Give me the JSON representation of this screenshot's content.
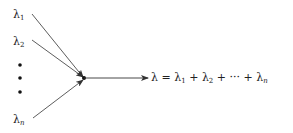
{
  "diagram": {
    "inputs": [
      {
        "symbol": "λ",
        "subscript": "1"
      },
      {
        "symbol": "λ",
        "subscript": "2"
      },
      {
        "symbol": "λ",
        "subscript": "n"
      }
    ],
    "ellipsis": "vertical-dots",
    "output": {
      "lhs": "λ",
      "equals": " = ",
      "terms": [
        {
          "symbol": "λ",
          "subscript": "1"
        },
        {
          "sep": " + "
        },
        {
          "symbol": "λ",
          "subscript": "2"
        },
        {
          "sep": " + ··· + "
        },
        {
          "symbol": "λ",
          "subscript": "n"
        }
      ]
    },
    "colors": {
      "line": "#333333",
      "text": "#222222"
    }
  }
}
